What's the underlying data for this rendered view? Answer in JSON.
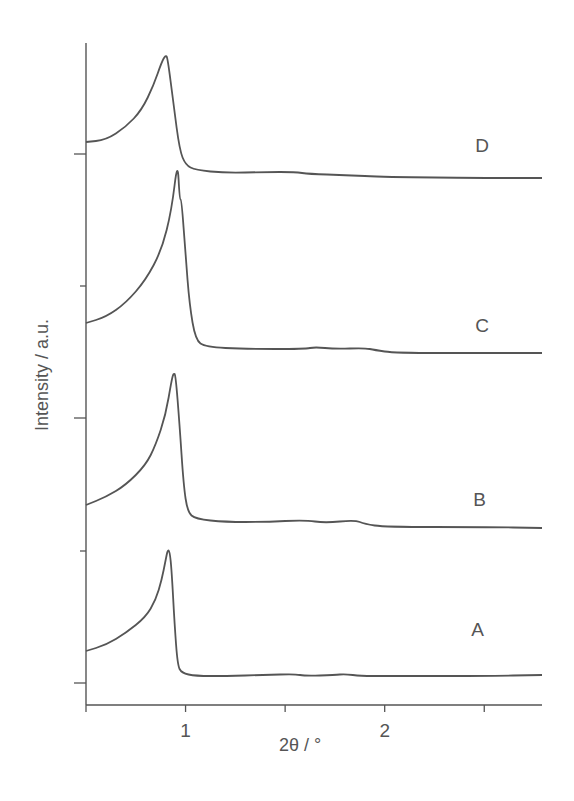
{
  "chart_data": {
    "type": "line",
    "title": "",
    "xlabel": "2θ / °",
    "ylabel": "Intensity / a.u.",
    "xlim": [
      0.5,
      2.79
    ],
    "ylim": [
      0,
      66.2
    ],
    "xticks": [
      0.5,
      1,
      1.5,
      2,
      2.5
    ],
    "xtick_labels": [
      "",
      "1",
      "",
      "2",
      ""
    ],
    "yticks_major": [
      2.2,
      28.7,
      55.1
    ],
    "yticks_minor": [
      15.4,
      41.9
    ],
    "ytick_labels": [],
    "grid": false,
    "legend": "none",
    "line_color": "#555555",
    "series": [
      {
        "name": "A",
        "label_pos": [
          2.47,
          7.5
        ],
        "points": [
          [
            0.5,
            5.4
          ],
          [
            0.6,
            6.0
          ],
          [
            0.7,
            7.2
          ],
          [
            0.8,
            8.8
          ],
          [
            0.85,
            10.5
          ],
          [
            0.88,
            12.5
          ],
          [
            0.9,
            14.5
          ],
          [
            0.91,
            15.5
          ],
          [
            0.92,
            15.4
          ],
          [
            0.93,
            13.5
          ],
          [
            0.945,
            8.0
          ],
          [
            0.96,
            4.0
          ],
          [
            0.98,
            3.2
          ],
          [
            1.05,
            2.9
          ],
          [
            1.2,
            2.9
          ],
          [
            1.4,
            3.0
          ],
          [
            1.55,
            3.1
          ],
          [
            1.6,
            2.9
          ],
          [
            1.75,
            3.0
          ],
          [
            1.8,
            3.1
          ],
          [
            1.88,
            2.9
          ],
          [
            2.0,
            2.9
          ],
          [
            2.5,
            2.9
          ],
          [
            2.79,
            3.0
          ]
        ]
      },
      {
        "name": "B",
        "label_pos": [
          2.48,
          20.5
        ],
        "points": [
          [
            0.5,
            20.0
          ],
          [
            0.6,
            20.8
          ],
          [
            0.7,
            22.0
          ],
          [
            0.8,
            24.0
          ],
          [
            0.85,
            26.0
          ],
          [
            0.9,
            29.0
          ],
          [
            0.93,
            32.5
          ],
          [
            0.94,
            33.2
          ],
          [
            0.95,
            33.0
          ],
          [
            0.97,
            28.0
          ],
          [
            0.99,
            22.0
          ],
          [
            1.01,
            19.3
          ],
          [
            1.05,
            18.6
          ],
          [
            1.2,
            18.3
          ],
          [
            1.4,
            18.3
          ],
          [
            1.6,
            18.5
          ],
          [
            1.7,
            18.2
          ],
          [
            1.85,
            18.5
          ],
          [
            1.9,
            18.1
          ],
          [
            2.0,
            17.8
          ],
          [
            2.5,
            17.8
          ],
          [
            2.79,
            17.7
          ]
        ]
      },
      {
        "name": "C",
        "label_pos": [
          2.49,
          37.9
        ],
        "points": [
          [
            0.5,
            38.2
          ],
          [
            0.6,
            38.8
          ],
          [
            0.7,
            40.2
          ],
          [
            0.8,
            42.5
          ],
          [
            0.88,
            45.5
          ],
          [
            0.93,
            49.5
          ],
          [
            0.96,
            54.5
          ],
          [
            0.97,
            50.6
          ],
          [
            0.98,
            50.5
          ],
          [
            1.0,
            45.0
          ],
          [
            1.02,
            40.0
          ],
          [
            1.05,
            36.5
          ],
          [
            1.1,
            35.8
          ],
          [
            1.3,
            35.6
          ],
          [
            1.6,
            35.6
          ],
          [
            1.65,
            35.8
          ],
          [
            1.75,
            35.6
          ],
          [
            1.9,
            35.7
          ],
          [
            1.95,
            35.5
          ],
          [
            2.05,
            35.2
          ],
          [
            2.5,
            35.2
          ],
          [
            2.79,
            35.2
          ]
        ]
      },
      {
        "name": "D",
        "label_pos": [
          2.49,
          55.9
        ],
        "points": [
          [
            0.5,
            56.3
          ],
          [
            0.6,
            56.5
          ],
          [
            0.7,
            57.8
          ],
          [
            0.78,
            59.5
          ],
          [
            0.84,
            62.0
          ],
          [
            0.88,
            64.3
          ],
          [
            0.9,
            65.0
          ],
          [
            0.91,
            64.7
          ],
          [
            0.94,
            60.0
          ],
          [
            0.97,
            55.5
          ],
          [
            1.0,
            54.0
          ],
          [
            1.05,
            53.5
          ],
          [
            1.2,
            53.2
          ],
          [
            1.4,
            53.3
          ],
          [
            1.55,
            53.3
          ],
          [
            1.62,
            53.1
          ],
          [
            1.8,
            53.0
          ],
          [
            2.0,
            52.8
          ],
          [
            2.5,
            52.7
          ],
          [
            2.79,
            52.7
          ]
        ]
      }
    ]
  }
}
